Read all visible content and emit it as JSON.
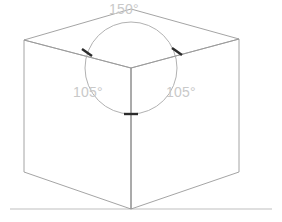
{
  "diagram": {
    "shape": "cube",
    "projection": "isometric",
    "labels": {
      "top_angle": "150°",
      "left_angle": "105°",
      "right_angle": "105°"
    },
    "colors": {
      "edge": "#9a9a9a",
      "arc": "#a8a8a8",
      "tick": "#2b2b2b",
      "label_text": "#c9c9c9",
      "ground_line": "#bfbfbf",
      "background": "#ffffff"
    },
    "geometry": {
      "top_apex": [
        131,
        9
      ],
      "top_left": [
        24,
        40
      ],
      "top_right": [
        239,
        39
      ],
      "center_vertex": [
        131,
        68
      ],
      "bottom_left": [
        24,
        172
      ],
      "bottom_right": [
        239,
        172
      ],
      "bottom_vertex": [
        131,
        209
      ],
      "circle_center": [
        131,
        68
      ],
      "circle_radius": 46,
      "ground_line_y": 209,
      "ground_line_x_start": 10,
      "ground_line_x_end": 272,
      "tick_left": [
        87,
        52
      ],
      "tick_right": [
        177,
        51
      ],
      "tick_bottom": [
        131,
        114
      ]
    }
  }
}
